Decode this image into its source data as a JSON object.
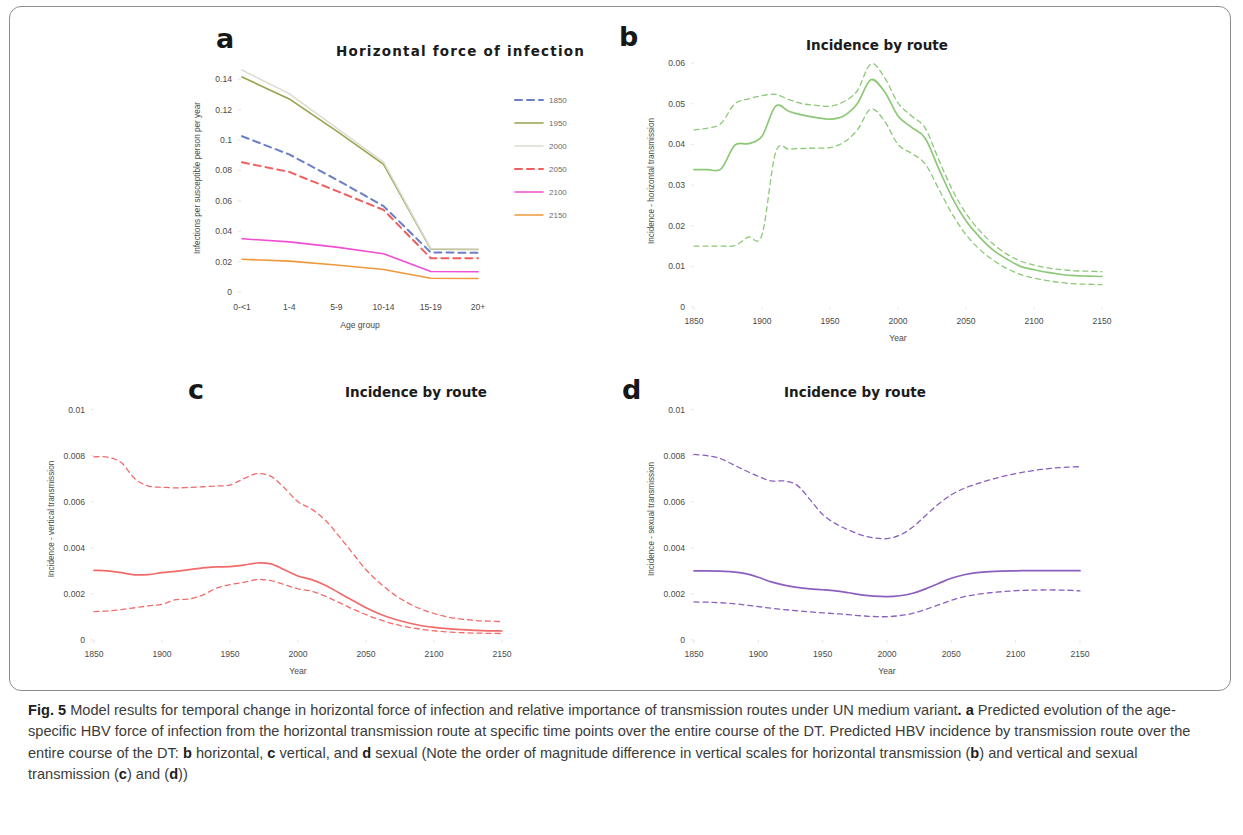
{
  "figure": {
    "label": "Fig. 5",
    "caption_part1": " Model results for temporal change in horizontal force of infection and relative importance of transmission routes under UN medium variant",
    "caption_part2": ". ",
    "caption_a_marker": "a",
    "caption_a_text": " Predicted evolution of the age-specific HBV force of infection from the horizontal transmission route at specific time points over the entire course of the DT. Predicted HBV incidence by transmission route over the entire course of the DT: ",
    "caption_b_marker": "b",
    "caption_b_text": " horizontal, ",
    "caption_c_marker": "c",
    "caption_c_text": " vertical, and ",
    "caption_d_marker": "d",
    "caption_d_text": " sexual (Note the order of magnitude difference in vertical scales for horizontal transmission (",
    "caption_b2_marker": "b",
    "caption_mid_text": ") and vertical and sexual transmission (",
    "caption_c2_marker": "c",
    "caption_and": ") and (",
    "caption_d2_marker": "d",
    "caption_end": "))"
  },
  "panels": [
    {
      "id": "a",
      "letter": "a",
      "title": "Horizontal  force  of infection"
    },
    {
      "id": "b",
      "letter": "b",
      "title": "Incidence by route"
    },
    {
      "id": "c",
      "letter": "c",
      "title": "Incidence by route"
    },
    {
      "id": "d",
      "letter": "d",
      "title": "Incidence by route"
    }
  ],
  "chart_data": [
    {
      "panel": "a",
      "type": "line",
      "title": "Horizontal  force  of infection",
      "xlabel": "Age group",
      "ylabel": "Infections per susceptible person per year",
      "categories": [
        "0-<1",
        "1-4",
        "5-9",
        "10-14",
        "15-19",
        "20+"
      ],
      "yticks": [
        0,
        0.02,
        0.04,
        0.06,
        0.08,
        0.1,
        0.12,
        0.14
      ],
      "ytick_labels": [
        "0",
        "0.02",
        "0.04",
        "0.06",
        "0.08",
        "0.1",
        "0.12",
        "0.14"
      ],
      "ylim": [
        0,
        0.15
      ],
      "grid": false,
      "legend_position": "right",
      "series": [
        {
          "name": "1850",
          "color": "#6b7fc7",
          "dash": "dashed",
          "values": [
            0.1025,
            0.0905,
            0.074,
            0.0565,
            0.026,
            0.0258
          ]
        },
        {
          "name": "1950",
          "color": "#9aa14a",
          "dash": "solid",
          "values": [
            0.1415,
            0.127,
            0.106,
            0.084,
            0.0282,
            0.028
          ]
        },
        {
          "name": "2000",
          "color": "#dcdcd2",
          "dash": "solid",
          "values": [
            0.146,
            0.1305,
            0.108,
            0.0855,
            0.0285,
            0.0283
          ]
        },
        {
          "name": "2050",
          "color": "#ef5f5f",
          "dash": "dashed",
          "values": [
            0.0853,
            0.079,
            0.0665,
            0.054,
            0.0222,
            0.0222
          ]
        },
        {
          "name": "2100",
          "color": "#ef4fd2",
          "dash": "solid",
          "values": [
            0.035,
            0.033,
            0.0295,
            0.0252,
            0.0135,
            0.0133
          ]
        },
        {
          "name": "2150",
          "color": "#f0983c",
          "dash": "solid",
          "values": [
            0.0215,
            0.0203,
            0.0178,
            0.0148,
            0.009,
            0.0089
          ]
        }
      ]
    },
    {
      "panel": "b",
      "type": "line",
      "title": "Incidence by route",
      "xlabel": "Year",
      "ylabel": "Incidence - horizontal transmission",
      "xticks": [
        1850,
        1900,
        1950,
        2000,
        2050,
        2100,
        2150
      ],
      "xtick_labels": [
        "1850",
        "1900",
        "1950",
        "2000",
        "2050",
        "2100",
        "2150"
      ],
      "yticks": [
        0,
        0.01,
        0.02,
        0.03,
        0.04,
        0.05,
        0.06
      ],
      "ytick_labels": [
        "0",
        "0.01",
        "0.02",
        "0.03",
        "0.04",
        "0.05",
        "0.06"
      ],
      "xlim": [
        1850,
        2150
      ],
      "ylim": [
        0,
        0.062
      ],
      "color": "#8cc878",
      "grid": false,
      "x": [
        1850,
        1860,
        1870,
        1880,
        1890,
        1900,
        1910,
        1920,
        1930,
        1940,
        1950,
        1960,
        1970,
        1980,
        1990,
        2000,
        2010,
        2020,
        2030,
        2040,
        2050,
        2060,
        2070,
        2080,
        2090,
        2100,
        2110,
        2120,
        2130,
        2140,
        2150
      ],
      "series": [
        {
          "name": "mean",
          "dash": "solid",
          "values": [
            0.0338,
            0.0338,
            0.034,
            0.0398,
            0.0402,
            0.042,
            0.0494,
            0.0481,
            0.0472,
            0.0466,
            0.0462,
            0.047,
            0.05,
            0.0559,
            0.053,
            0.047,
            0.0442,
            0.0415,
            0.034,
            0.0268,
            0.0212,
            0.0172,
            0.014,
            0.0118,
            0.01,
            0.0092,
            0.0085,
            0.008,
            0.0077,
            0.0076,
            0.0075
          ]
        },
        {
          "name": "upper",
          "dash": "dashed",
          "values": [
            0.0436,
            0.044,
            0.0452,
            0.05,
            0.0512,
            0.052,
            0.0523,
            0.051,
            0.05,
            0.0496,
            0.0494,
            0.0505,
            0.0532,
            0.0598,
            0.0565,
            0.0502,
            0.047,
            0.044,
            0.0362,
            0.0288,
            0.023,
            0.0188,
            0.0155,
            0.013,
            0.0113,
            0.0103,
            0.0096,
            0.0092,
            0.0089,
            0.0088,
            0.0087
          ]
        },
        {
          "name": "lower",
          "dash": "dashed",
          "values": [
            0.015,
            0.015,
            0.015,
            0.0151,
            0.0172,
            0.0178,
            0.038,
            0.0388,
            0.039,
            0.0391,
            0.0392,
            0.0405,
            0.0435,
            0.0487,
            0.0458,
            0.04,
            0.0378,
            0.0352,
            0.029,
            0.0228,
            0.0178,
            0.0142,
            0.0115,
            0.0095,
            0.008,
            0.0071,
            0.0065,
            0.006,
            0.0057,
            0.0056,
            0.0055
          ]
        }
      ]
    },
    {
      "panel": "c",
      "type": "line",
      "title": "Incidence by route",
      "xlabel": "Year",
      "ylabel": "Incidence - vertical transmission",
      "xticks": [
        1850,
        1900,
        1950,
        2000,
        2050,
        2100,
        2150
      ],
      "xtick_labels": [
        "1850",
        "1900",
        "1950",
        "2000",
        "2050",
        "2100",
        "2150"
      ],
      "yticks": [
        0,
        0.002,
        0.004,
        0.006,
        0.008,
        0.01
      ],
      "ytick_labels": [
        "0",
        "0.002",
        "0.004",
        "0.006",
        "0.008",
        "0.01"
      ],
      "xlim": [
        1850,
        2150
      ],
      "ylim": [
        0,
        0.0105
      ],
      "color": "#f26b6b",
      "grid": false,
      "x": [
        1850,
        1860,
        1870,
        1880,
        1890,
        1900,
        1910,
        1920,
        1930,
        1940,
        1950,
        1960,
        1970,
        1980,
        1990,
        2000,
        2010,
        2020,
        2030,
        2040,
        2050,
        2060,
        2070,
        2080,
        2090,
        2100,
        2110,
        2120,
        2130,
        2140,
        2150
      ],
      "series": [
        {
          "name": "mean",
          "dash": "solid",
          "values": [
            0.00302,
            0.003,
            0.00292,
            0.00283,
            0.00284,
            0.00292,
            0.00298,
            0.00305,
            0.00313,
            0.00317,
            0.00318,
            0.00325,
            0.00334,
            0.0033,
            0.00305,
            0.00278,
            0.00262,
            0.00238,
            0.00205,
            0.00172,
            0.0014,
            0.00113,
            0.00092,
            0.00076,
            0.00063,
            0.00055,
            0.00049,
            0.00045,
            0.00042,
            0.0004,
            0.00039
          ]
        },
        {
          "name": "upper",
          "dash": "dashed",
          "values": [
            0.00795,
            0.00793,
            0.0077,
            0.007,
            0.00668,
            0.00663,
            0.0066,
            0.00662,
            0.00665,
            0.00668,
            0.00672,
            0.007,
            0.00722,
            0.0071,
            0.0066,
            0.006,
            0.00568,
            0.0052,
            0.00452,
            0.00378,
            0.00305,
            0.00248,
            0.002,
            0.00163,
            0.00135,
            0.00115,
            0.001,
            0.00091,
            0.00085,
            0.00082,
            0.0008
          ]
        },
        {
          "name": "lower",
          "dash": "dashed",
          "values": [
            0.00123,
            0.00126,
            0.00132,
            0.0014,
            0.00148,
            0.00155,
            0.00175,
            0.00178,
            0.00195,
            0.00225,
            0.0024,
            0.0025,
            0.00262,
            0.00258,
            0.0024,
            0.00222,
            0.00212,
            0.0019,
            0.00163,
            0.00135,
            0.0011,
            0.00088,
            0.0007,
            0.00057,
            0.00047,
            0.0004,
            0.00035,
            0.00032,
            0.0003,
            0.00029,
            0.00028
          ]
        }
      ]
    },
    {
      "panel": "d",
      "type": "line",
      "title": "Incidence by route",
      "xlabel": "Year",
      "ylabel": "Incidence - sexual transmission",
      "xticks": [
        1850,
        1900,
        1950,
        2000,
        2050,
        2100,
        2150
      ],
      "xtick_labels": [
        "1850",
        "1900",
        "1950",
        "2000",
        "2050",
        "2100",
        "2150"
      ],
      "yticks": [
        0,
        0.002,
        0.004,
        0.006,
        0.008,
        0.01
      ],
      "ytick_labels": [
        "0",
        "0.002",
        "0.004",
        "0.006",
        "0.008",
        "0.01"
      ],
      "xlim": [
        1850,
        2150
      ],
      "ylim": [
        0,
        0.0105
      ],
      "color": "#8b5fbf",
      "grid": false,
      "x": [
        1850,
        1860,
        1870,
        1880,
        1890,
        1900,
        1910,
        1920,
        1930,
        1940,
        1950,
        1960,
        1970,
        1980,
        1990,
        2000,
        2010,
        2020,
        2030,
        2040,
        2050,
        2060,
        2070,
        2080,
        2090,
        2100,
        2110,
        2120,
        2130,
        2140,
        2150
      ],
      "series": [
        {
          "name": "mean",
          "dash": "solid",
          "values": [
            0.003,
            0.003,
            0.00299,
            0.00296,
            0.00288,
            0.00272,
            0.00252,
            0.00238,
            0.00228,
            0.00222,
            0.00218,
            0.00213,
            0.00205,
            0.00196,
            0.0019,
            0.00188,
            0.00192,
            0.00203,
            0.00222,
            0.00245,
            0.00268,
            0.00283,
            0.00292,
            0.00297,
            0.00299,
            0.003,
            0.00301,
            0.00301,
            0.00301,
            0.00301,
            0.00301
          ]
        },
        {
          "name": "upper",
          "dash": "dashed",
          "values": [
            0.00805,
            0.008,
            0.00788,
            0.00762,
            0.00735,
            0.0071,
            0.0069,
            0.0069,
            0.00672,
            0.0061,
            0.00545,
            0.00505,
            0.00478,
            0.00455,
            0.00443,
            0.0044,
            0.00455,
            0.0049,
            0.0054,
            0.0059,
            0.0063,
            0.00658,
            0.00678,
            0.00695,
            0.0071,
            0.00722,
            0.00732,
            0.0074,
            0.00746,
            0.0075,
            0.00752
          ]
        },
        {
          "name": "lower",
          "dash": "dashed",
          "values": [
            0.00165,
            0.00164,
            0.00162,
            0.00158,
            0.00152,
            0.00145,
            0.00138,
            0.00132,
            0.00127,
            0.00122,
            0.00118,
            0.00114,
            0.0011,
            0.00105,
            0.00102,
            0.00101,
            0.00106,
            0.00116,
            0.00133,
            0.00152,
            0.00172,
            0.00188,
            0.00198,
            0.00205,
            0.0021,
            0.00214,
            0.00216,
            0.00217,
            0.00217,
            0.00216,
            0.00213
          ]
        }
      ]
    }
  ]
}
